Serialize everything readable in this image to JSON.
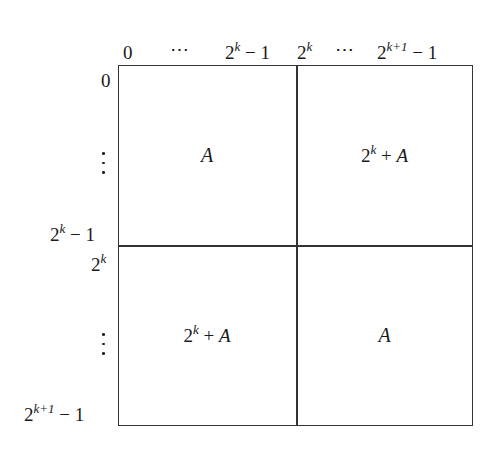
{
  "diagram": {
    "type": "block-matrix",
    "column_labels": {
      "c0": "0",
      "c1": "⋯",
      "c2_base": "2",
      "c2_exp": "k",
      "c2_tail": " − 1",
      "c3_base": "2",
      "c3_exp": "k",
      "c4": "⋯",
      "c5_base": "2",
      "c5_exp": "k+1",
      "c5_tail": " − 1"
    },
    "row_labels": {
      "r0": "0",
      "r1": "vertical-ellipsis",
      "r2_base": "2",
      "r2_exp": "k",
      "r2_tail": " − 1",
      "r3_base": "2",
      "r3_exp": "k",
      "r4": "vertical-ellipsis",
      "r5_base": "2",
      "r5_exp": "k+1",
      "r5_tail": " − 1"
    },
    "cells": {
      "top_left": {
        "text": "A"
      },
      "top_right": {
        "prefix_base": "2",
        "prefix_exp": "k",
        "op": " + ",
        "var": "A"
      },
      "bottom_left": {
        "prefix_base": "2",
        "prefix_exp": "k",
        "op": " + ",
        "var": "A"
      },
      "bottom_right": {
        "text": "A"
      }
    },
    "colors": {
      "line": "#333333",
      "text": "#1a1a1a",
      "background": "#ffffff"
    }
  }
}
